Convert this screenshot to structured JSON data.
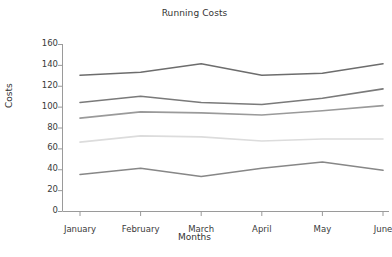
{
  "chart_data": {
    "type": "line",
    "title": "Running Costs",
    "xlabel": "Months",
    "ylabel": "Costs",
    "categories": [
      "January",
      "February",
      "March",
      "April",
      "May",
      "June"
    ],
    "yticks": [
      0,
      20,
      40,
      60,
      80,
      100,
      120,
      140,
      160
    ],
    "ylim": [
      0,
      160
    ],
    "xlim": [
      0,
      5
    ],
    "grid": false,
    "legend": "none",
    "series": [
      {
        "name": "series-1",
        "color": "#6d6d6d",
        "values": [
          130,
          133,
          141,
          130,
          132,
          141
        ]
      },
      {
        "name": "series-2",
        "color": "#7a7a7a",
        "values": [
          104,
          110,
          104,
          102,
          108,
          117
        ]
      },
      {
        "name": "series-3",
        "color": "#9a9a9a",
        "values": [
          89,
          95,
          94,
          92,
          96,
          101
        ]
      },
      {
        "name": "series-4",
        "color": "#dcdcdc",
        "values": [
          66,
          72,
          71,
          67,
          69,
          69
        ]
      },
      {
        "name": "series-5",
        "color": "#878787",
        "values": [
          35,
          41,
          33,
          41,
          47,
          39
        ]
      }
    ]
  },
  "axes": {
    "tick_color": "#9a9a9a",
    "spine_color": "#9a9a9a"
  }
}
